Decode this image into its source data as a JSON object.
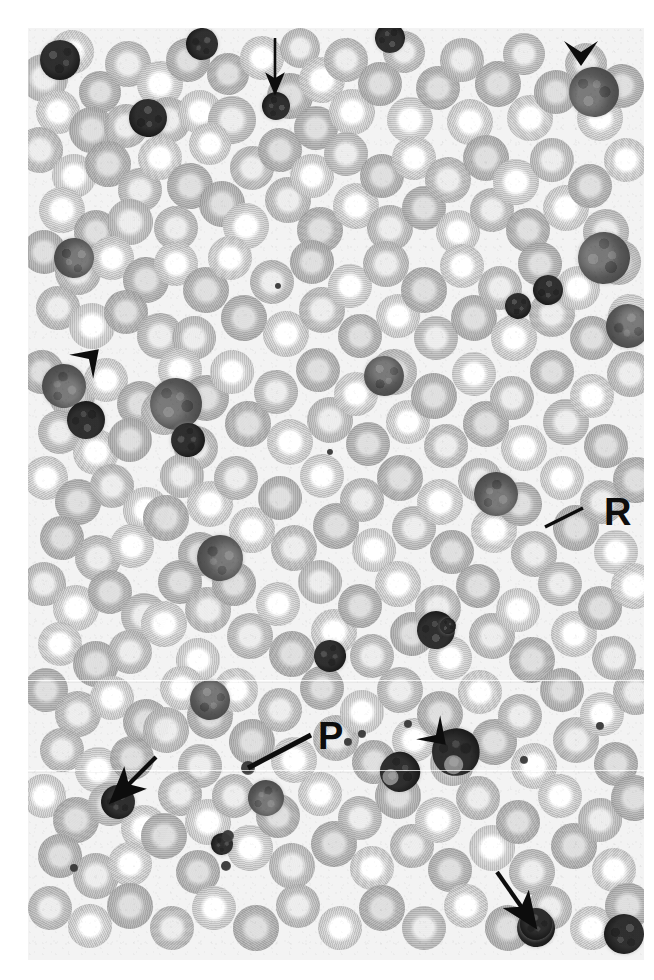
{
  "figure": {
    "kind": "photomicrograph",
    "stain_appearance": "monochrome / grayscale halftone print",
    "width_px": 654,
    "height_px": 980,
    "page_background": "#ffffff",
    "field_background": "#f2f1ef",
    "ink_color": "#0d0d0d"
  },
  "labels": [
    {
      "id": "R",
      "text": "R",
      "x": 604,
      "y": 493,
      "leader": {
        "x1": 583,
        "y1": 508,
        "x2": 545,
        "y2": 527
      },
      "points_at": "clustered red blood cells"
    },
    {
      "id": "P",
      "text": "P",
      "x": 318,
      "y": 717,
      "leader": {
        "x1": 311,
        "y1": 735,
        "x2": 248,
        "y2": 768
      },
      "points_at": "platelet"
    }
  ],
  "arrows": [
    {
      "id": "arrow-top",
      "x1": 275,
      "y1": 38,
      "x2": 275,
      "y2": 92,
      "direction": "down",
      "points_at": "small dark nucleated cell"
    },
    {
      "id": "arrow-bottom-left",
      "x1": 156,
      "y1": 757,
      "x2": 113,
      "y2": 800,
      "direction": "down-left",
      "points_at": "small dark nucleated cell"
    },
    {
      "id": "arrow-bottom-right",
      "x1": 497,
      "y1": 872,
      "x2": 534,
      "y2": 925,
      "direction": "down-right",
      "points_at": "small dark nucleated cell"
    }
  ],
  "arrowheads": [
    {
      "id": "arrowhead-top-right",
      "x": 581,
      "y": 62,
      "rotation_deg": 0,
      "points_at": "large dark mononuclear cell"
    },
    {
      "id": "arrowhead-left",
      "x": 96,
      "y": 352,
      "rotation_deg": 225,
      "points_at": "dark lobed cell cluster"
    },
    {
      "id": "arrowhead-bottom-center",
      "x": 443,
      "y": 742,
      "rotation_deg": 315,
      "points_at": "segmented neutrophil"
    }
  ],
  "cell_field": {
    "rbc": [
      [
        44,
        78,
        24
      ],
      [
        72,
        52,
        22
      ],
      [
        100,
        92,
        21
      ],
      [
        128,
        64,
        23
      ],
      [
        58,
        112,
        22
      ],
      [
        92,
        130,
        23
      ],
      [
        126,
        126,
        22
      ],
      [
        160,
        84,
        23
      ],
      [
        188,
        60,
        22
      ],
      [
        168,
        120,
        23
      ],
      [
        200,
        112,
        22
      ],
      [
        228,
        74,
        21
      ],
      [
        232,
        120,
        24
      ],
      [
        262,
        58,
        22
      ],
      [
        290,
        96,
        23
      ],
      [
        300,
        48,
        20
      ],
      [
        322,
        80,
        23
      ],
      [
        316,
        128,
        22
      ],
      [
        346,
        60,
        22
      ],
      [
        352,
        112,
        23
      ],
      [
        380,
        84,
        22
      ],
      [
        404,
        52,
        21
      ],
      [
        410,
        120,
        23
      ],
      [
        438,
        88,
        22
      ],
      [
        462,
        60,
        22
      ],
      [
        470,
        122,
        23
      ],
      [
        498,
        84,
        23
      ],
      [
        524,
        54,
        21
      ],
      [
        530,
        118,
        23
      ],
      [
        556,
        92,
        22
      ],
      [
        586,
        64,
        21
      ],
      [
        600,
        118,
        23
      ],
      [
        622,
        86,
        22
      ],
      [
        40,
        150,
        23
      ],
      [
        74,
        176,
        22
      ],
      [
        108,
        164,
        23
      ],
      [
        140,
        190,
        22
      ],
      [
        62,
        210,
        23
      ],
      [
        96,
        232,
        22
      ],
      [
        130,
        222,
        23
      ],
      [
        160,
        158,
        22
      ],
      [
        190,
        186,
        23
      ],
      [
        176,
        228,
        22
      ],
      [
        210,
        144,
        21
      ],
      [
        222,
        204,
        23
      ],
      [
        252,
        168,
        22
      ],
      [
        246,
        226,
        23
      ],
      [
        280,
        150,
        22
      ],
      [
        288,
        200,
        23
      ],
      [
        312,
        176,
        22
      ],
      [
        320,
        230,
        23
      ],
      [
        346,
        154,
        22
      ],
      [
        356,
        206,
        23
      ],
      [
        382,
        176,
        22
      ],
      [
        390,
        228,
        23
      ],
      [
        414,
        158,
        22
      ],
      [
        424,
        208,
        22
      ],
      [
        448,
        180,
        23
      ],
      [
        458,
        232,
        22
      ],
      [
        486,
        158,
        23
      ],
      [
        492,
        210,
        22
      ],
      [
        516,
        182,
        23
      ],
      [
        528,
        230,
        22
      ],
      [
        552,
        160,
        22
      ],
      [
        566,
        208,
        23
      ],
      [
        590,
        186,
        22
      ],
      [
        606,
        232,
        23
      ],
      [
        626,
        160,
        22
      ],
      [
        44,
        252,
        22
      ],
      [
        78,
        272,
        23
      ],
      [
        112,
        258,
        22
      ],
      [
        146,
        280,
        23
      ],
      [
        58,
        308,
        22
      ],
      [
        92,
        326,
        23
      ],
      [
        126,
        312,
        22
      ],
      [
        160,
        336,
        23
      ],
      [
        176,
        264,
        22
      ],
      [
        206,
        290,
        23
      ],
      [
        194,
        338,
        22
      ],
      [
        230,
        258,
        22
      ],
      [
        244,
        318,
        23
      ],
      [
        272,
        282,
        22
      ],
      [
        286,
        334,
        23
      ],
      [
        312,
        262,
        22
      ],
      [
        322,
        310,
        23
      ],
      [
        350,
        286,
        22
      ],
      [
        360,
        336,
        22
      ],
      [
        386,
        264,
        23
      ],
      [
        398,
        316,
        22
      ],
      [
        424,
        290,
        23
      ],
      [
        436,
        338,
        22
      ],
      [
        462,
        266,
        22
      ],
      [
        474,
        318,
        23
      ],
      [
        500,
        288,
        22
      ],
      [
        514,
        338,
        23
      ],
      [
        540,
        264,
        22
      ],
      [
        552,
        314,
        23
      ],
      [
        578,
        288,
        22
      ],
      [
        592,
        338,
        22
      ],
      [
        618,
        262,
        23
      ],
      [
        630,
        316,
        22
      ],
      [
        42,
        372,
        22
      ],
      [
        72,
        396,
        23
      ],
      [
        106,
        380,
        22
      ],
      [
        140,
        404,
        23
      ],
      [
        60,
        432,
        22
      ],
      [
        96,
        452,
        23
      ],
      [
        130,
        440,
        22
      ],
      [
        164,
        412,
        23
      ],
      [
        180,
        370,
        22
      ],
      [
        206,
        398,
        23
      ],
      [
        196,
        448,
        22
      ],
      [
        232,
        372,
        22
      ],
      [
        248,
        424,
        23
      ],
      [
        276,
        392,
        22
      ],
      [
        290,
        442,
        23
      ],
      [
        318,
        370,
        22
      ],
      [
        330,
        420,
        23
      ],
      [
        356,
        394,
        22
      ],
      [
        368,
        444,
        22
      ],
      [
        394,
        372,
        23
      ],
      [
        408,
        422,
        22
      ],
      [
        434,
        396,
        23
      ],
      [
        446,
        446,
        22
      ],
      [
        474,
        374,
        22
      ],
      [
        486,
        424,
        23
      ],
      [
        512,
        398,
        22
      ],
      [
        524,
        448,
        23
      ],
      [
        552,
        372,
        22
      ],
      [
        566,
        422,
        23
      ],
      [
        592,
        396,
        22
      ],
      [
        606,
        446,
        22
      ],
      [
        630,
        374,
        23
      ],
      [
        46,
        478,
        22
      ],
      [
        78,
        502,
        23
      ],
      [
        112,
        486,
        22
      ],
      [
        146,
        510,
        23
      ],
      [
        62,
        538,
        22
      ],
      [
        98,
        558,
        23
      ],
      [
        132,
        546,
        22
      ],
      [
        166,
        518,
        23
      ],
      [
        182,
        476,
        22
      ],
      [
        210,
        504,
        23
      ],
      [
        200,
        554,
        22
      ],
      [
        236,
        478,
        22
      ],
      [
        252,
        530,
        23
      ],
      [
        280,
        498,
        22
      ],
      [
        294,
        548,
        23
      ],
      [
        322,
        476,
        22
      ],
      [
        336,
        526,
        23
      ],
      [
        362,
        500,
        22
      ],
      [
        374,
        550,
        22
      ],
      [
        400,
        478,
        23
      ],
      [
        414,
        528,
        22
      ],
      [
        440,
        502,
        23
      ],
      [
        452,
        552,
        22
      ],
      [
        480,
        480,
        22
      ],
      [
        494,
        530,
        23
      ],
      [
        520,
        504,
        22
      ],
      [
        534,
        554,
        23
      ],
      [
        562,
        478,
        22
      ],
      [
        576,
        528,
        23
      ],
      [
        602,
        502,
        22
      ],
      [
        616,
        552,
        22
      ],
      [
        636,
        480,
        23
      ],
      [
        44,
        584,
        22
      ],
      [
        76,
        608,
        23
      ],
      [
        110,
        592,
        22
      ],
      [
        144,
        616,
        23
      ],
      [
        60,
        644,
        22
      ],
      [
        96,
        664,
        23
      ],
      [
        130,
        652,
        22
      ],
      [
        164,
        624,
        23
      ],
      [
        180,
        582,
        22
      ],
      [
        208,
        610,
        23
      ],
      [
        198,
        660,
        22
      ],
      [
        234,
        584,
        22
      ],
      [
        250,
        636,
        23
      ],
      [
        278,
        604,
        22
      ],
      [
        292,
        654,
        23
      ],
      [
        320,
        582,
        22
      ],
      [
        334,
        632,
        23
      ],
      [
        360,
        606,
        22
      ],
      [
        372,
        656,
        22
      ],
      [
        398,
        584,
        23
      ],
      [
        412,
        634,
        22
      ],
      [
        438,
        608,
        23
      ],
      [
        450,
        658,
        22
      ],
      [
        478,
        586,
        22
      ],
      [
        492,
        636,
        23
      ],
      [
        518,
        610,
        22
      ],
      [
        532,
        660,
        23
      ],
      [
        560,
        584,
        22
      ],
      [
        574,
        634,
        23
      ],
      [
        600,
        608,
        22
      ],
      [
        614,
        658,
        22
      ],
      [
        634,
        586,
        23
      ],
      [
        46,
        690,
        22
      ],
      [
        78,
        714,
        23
      ],
      [
        112,
        698,
        22
      ],
      [
        146,
        722,
        23
      ],
      [
        62,
        750,
        22
      ],
      [
        98,
        770,
        23
      ],
      [
        132,
        758,
        22
      ],
      [
        166,
        730,
        23
      ],
      [
        182,
        688,
        22
      ],
      [
        210,
        716,
        23
      ],
      [
        200,
        766,
        22
      ],
      [
        236,
        690,
        22
      ],
      [
        252,
        742,
        23
      ],
      [
        280,
        710,
        22
      ],
      [
        294,
        760,
        23
      ],
      [
        322,
        688,
        22
      ],
      [
        336,
        738,
        23
      ],
      [
        362,
        712,
        22
      ],
      [
        374,
        762,
        22
      ],
      [
        400,
        690,
        23
      ],
      [
        414,
        740,
        22
      ],
      [
        440,
        714,
        23
      ],
      [
        452,
        764,
        22
      ],
      [
        480,
        692,
        22
      ],
      [
        494,
        742,
        23
      ],
      [
        520,
        716,
        22
      ],
      [
        534,
        766,
        23
      ],
      [
        562,
        690,
        22
      ],
      [
        576,
        740,
        23
      ],
      [
        602,
        714,
        22
      ],
      [
        616,
        764,
        22
      ],
      [
        636,
        692,
        23
      ],
      [
        44,
        796,
        22
      ],
      [
        76,
        820,
        23
      ],
      [
        110,
        804,
        22
      ],
      [
        144,
        828,
        23
      ],
      [
        60,
        856,
        22
      ],
      [
        96,
        876,
        23
      ],
      [
        130,
        864,
        22
      ],
      [
        164,
        836,
        23
      ],
      [
        180,
        794,
        22
      ],
      [
        208,
        822,
        23
      ],
      [
        198,
        872,
        22
      ],
      [
        234,
        796,
        22
      ],
      [
        250,
        848,
        23
      ],
      [
        278,
        816,
        22
      ],
      [
        292,
        866,
        23
      ],
      [
        320,
        794,
        22
      ],
      [
        334,
        844,
        23
      ],
      [
        360,
        818,
        22
      ],
      [
        372,
        868,
        22
      ],
      [
        398,
        796,
        23
      ],
      [
        412,
        846,
        22
      ],
      [
        438,
        820,
        23
      ],
      [
        450,
        870,
        22
      ],
      [
        478,
        798,
        22
      ],
      [
        492,
        848,
        23
      ],
      [
        518,
        822,
        22
      ],
      [
        532,
        872,
        23
      ],
      [
        560,
        796,
        22
      ],
      [
        574,
        846,
        23
      ],
      [
        600,
        820,
        22
      ],
      [
        614,
        870,
        22
      ],
      [
        634,
        798,
        23
      ],
      [
        50,
        908,
        22
      ],
      [
        90,
        926,
        22
      ],
      [
        130,
        906,
        23
      ],
      [
        172,
        928,
        22
      ],
      [
        214,
        908,
        22
      ],
      [
        256,
        928,
        23
      ],
      [
        298,
        906,
        22
      ],
      [
        340,
        928,
        22
      ],
      [
        382,
        908,
        23
      ],
      [
        424,
        928,
        22
      ],
      [
        466,
        906,
        22
      ],
      [
        508,
        928,
        23
      ],
      [
        550,
        908,
        22
      ],
      [
        592,
        928,
        22
      ],
      [
        628,
        906,
        23
      ]
    ],
    "wbc": [
      [
        60,
        60,
        20,
        "dark"
      ],
      [
        148,
        118,
        19,
        "dark"
      ],
      [
        202,
        44,
        16,
        "dark"
      ],
      [
        276,
        106,
        14,
        "dark"
      ],
      [
        390,
        38,
        15,
        "dark"
      ],
      [
        594,
        92,
        25,
        "blast"
      ],
      [
        604,
        258,
        26,
        "blast"
      ],
      [
        518,
        306,
        13,
        "dark"
      ],
      [
        548,
        290,
        15,
        "dark"
      ],
      [
        74,
        258,
        20,
        "blast"
      ],
      [
        64,
        386,
        22,
        "blast"
      ],
      [
        86,
        420,
        19,
        "dark"
      ],
      [
        176,
        404,
        26,
        "blast"
      ],
      [
        188,
        440,
        17,
        "dark"
      ],
      [
        384,
        376,
        20,
        "blast"
      ],
      [
        628,
        326,
        22,
        "blast"
      ],
      [
        220,
        558,
        23,
        "blast"
      ],
      [
        496,
        494,
        22,
        "blast"
      ],
      [
        436,
        630,
        19,
        "dark"
      ],
      [
        448,
        626,
        0,
        "dark"
      ],
      [
        330,
        656,
        16,
        "dark"
      ],
      [
        210,
        700,
        20,
        "blast"
      ],
      [
        118,
        802,
        17,
        "dark"
      ],
      [
        222,
        844,
        11,
        "dark"
      ],
      [
        266,
        798,
        18,
        "blast"
      ],
      [
        456,
        752,
        24,
        "seg"
      ],
      [
        400,
        772,
        20,
        "seg"
      ],
      [
        536,
        928,
        19,
        "dark"
      ],
      [
        536,
        924,
        16,
        "dark"
      ],
      [
        624,
        934,
        20,
        "dark"
      ]
    ],
    "platelets": [
      [
        248,
        768,
        7
      ],
      [
        228,
        836,
        6
      ],
      [
        226,
        866,
        5
      ],
      [
        348,
        742,
        4
      ],
      [
        408,
        724,
        4
      ],
      [
        362,
        734,
        4
      ],
      [
        74,
        868,
        4
      ],
      [
        524,
        760,
        4
      ],
      [
        600,
        726,
        4
      ],
      [
        330,
        452,
        3
      ],
      [
        278,
        286,
        3
      ]
    ]
  },
  "caption_elements_present": false
}
